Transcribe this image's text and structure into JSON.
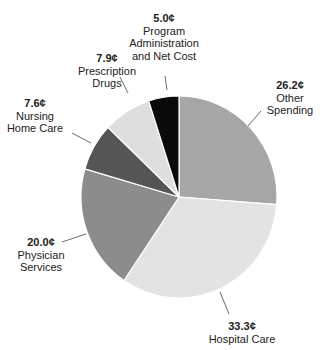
{
  "chart_data": {
    "type": "pie",
    "title": "",
    "unit": "¢",
    "slices": [
      {
        "label": "Other Spending",
        "value": 26.2,
        "display": "26.2¢",
        "color": "#a6a6a6"
      },
      {
        "label": "Hospital Care",
        "value": 33.3,
        "display": "33.3¢",
        "color": "#e3e3e3"
      },
      {
        "label": "Physician Services",
        "value": 20.0,
        "display": "20.0¢",
        "color": "#8c8c8c"
      },
      {
        "label": "Nursing Home Care",
        "value": 7.6,
        "display": "7.6¢",
        "color": "#555555"
      },
      {
        "label": "Prescription Drugs",
        "value": 7.9,
        "display": "7.9¢",
        "color": "#dedede"
      },
      {
        "label": "Program Administration and Net Cost",
        "value": 5.0,
        "display": "5.0¢",
        "color": "#0a0a0a"
      }
    ],
    "start_angle_deg": 0,
    "direction": "clockwise from 12 o'clock",
    "legend": "none (callout labels)"
  },
  "labels": {
    "other": {
      "value": "26.2¢",
      "line1": "Other",
      "line2": "Spending"
    },
    "hospital": {
      "value": "33.3¢",
      "line1": "Hospital Care"
    },
    "physician": {
      "value": "20.0¢",
      "line1": "Physician",
      "line2": "Services"
    },
    "nursing": {
      "value": "7.6¢",
      "line1": "Nursing",
      "line2": "Home Care"
    },
    "drugs": {
      "value": "7.9¢",
      "line1": "Prescription",
      "line2": "Drugs"
    },
    "admin": {
      "value": "5.0¢",
      "line1": "Program",
      "line2": "Administration",
      "line3": "and Net Cost"
    }
  }
}
